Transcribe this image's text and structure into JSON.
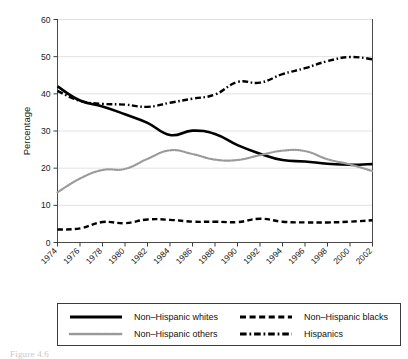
{
  "figure": {
    "caption": "Figure 4.6"
  },
  "chart_data": {
    "type": "line",
    "title": "",
    "xlabel": "",
    "ylabel": "Percentage",
    "ylim": [
      0,
      60
    ],
    "yticks": [
      0,
      10,
      20,
      30,
      40,
      50,
      60
    ],
    "ytick_labels": [
      "0",
      "10",
      "20",
      "30",
      "40",
      "50",
      "60"
    ],
    "grid": true,
    "grid_axis": "y",
    "legend_position": "below",
    "x": [
      1974,
      1976,
      1978,
      1980,
      1982,
      1984,
      1986,
      1988,
      1990,
      1992,
      1994,
      1996,
      1998,
      2000,
      2002
    ],
    "xtick_labels": [
      "1974",
      "1976",
      "1978",
      "1980",
      "1982",
      "1984",
      "1986",
      "1988",
      "1990",
      "1992",
      "1994",
      "1996",
      "1998",
      "2000",
      "2002"
    ],
    "categories": [
      "1974",
      "1976",
      "1978",
      "1980",
      "1982",
      "1984",
      "1986",
      "1988",
      "1990",
      "1992",
      "1994",
      "1996",
      "1998",
      "2000",
      "2002"
    ],
    "series": [
      {
        "name": "Non-Hispanic whites",
        "style": "solid",
        "color": "#000000",
        "values": [
          42.0,
          38.2,
          36.6,
          34.5,
          32.2,
          28.9,
          30.1,
          29.2,
          26.2,
          23.9,
          22.2,
          21.8,
          21.2,
          20.9,
          21.1
        ]
      },
      {
        "name": "Non-Hispanic blacks",
        "style": "dashed",
        "color": "#000000",
        "values": [
          3.5,
          3.8,
          5.5,
          5.2,
          6.2,
          6.1,
          5.6,
          5.6,
          5.5,
          6.4,
          5.6,
          5.4,
          5.4,
          5.6,
          6.0
        ]
      },
      {
        "name": "Non-Hispanic others",
        "style": "dotted",
        "color": "#9a9a9a",
        "values": [
          13.5,
          17.2,
          19.5,
          19.8,
          22.5,
          24.8,
          23.8,
          22.3,
          22.2,
          23.5,
          24.7,
          24.6,
          22.4,
          21.0,
          19.2
        ]
      },
      {
        "name": "Hispanics",
        "style": "dashdot",
        "color": "#000000",
        "values": [
          40.8,
          38.1,
          37.3,
          37.1,
          36.5,
          37.6,
          38.7,
          39.8,
          43.2,
          43.0,
          45.3,
          46.9,
          48.8,
          49.9,
          49.3
        ]
      }
    ]
  },
  "legend": {
    "items": [
      {
        "label": "Non-Hispanic whites",
        "style": "solid"
      },
      {
        "label": "Non-Hispanic blacks",
        "style": "dashed"
      },
      {
        "label": "Non-Hispanic others",
        "style": "dotted"
      },
      {
        "label": "Hispanics",
        "style": "dashdot"
      }
    ]
  }
}
